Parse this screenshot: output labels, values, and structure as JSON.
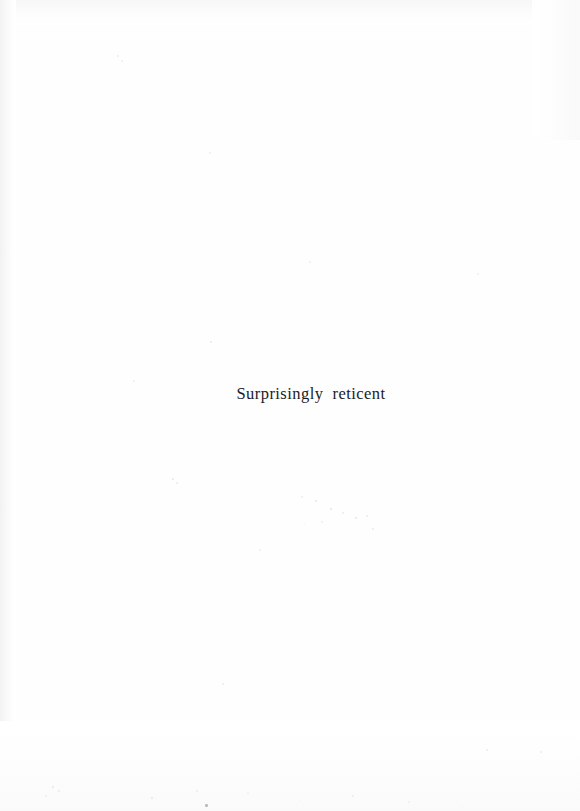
{
  "page": {
    "kind": "scanned-book-page",
    "width": 580,
    "height": 811,
    "background_color": "#ffffff",
    "paper_color": "#fefefe"
  },
  "content": {
    "line": "Surprisingly reticent",
    "text_color": "#1b1b1d",
    "alignment": "center"
  },
  "artifacts": {
    "label": "scan speckles",
    "specks": [
      {
        "x": 117,
        "y": 55,
        "size": 2.0,
        "color": "#eceded"
      },
      {
        "x": 121,
        "y": 60,
        "size": 1.6,
        "color": "#f0f0f1"
      },
      {
        "x": 173,
        "y": 117,
        "size": 1.4,
        "color": "#f1f1f2"
      },
      {
        "x": 209,
        "y": 152,
        "size": 1.5,
        "color": "#f0f0f1"
      },
      {
        "x": 309,
        "y": 261,
        "size": 1.8,
        "color": "#ebecec"
      },
      {
        "x": 477,
        "y": 273,
        "size": 1.5,
        "color": "#eff0f0"
      },
      {
        "x": 210,
        "y": 341,
        "size": 1.9,
        "color": "#e9eaea"
      },
      {
        "x": 133,
        "y": 380,
        "size": 1.5,
        "color": "#f0f0f1"
      },
      {
        "x": 172,
        "y": 478,
        "size": 2.2,
        "color": "#e6e7e8"
      },
      {
        "x": 176,
        "y": 482,
        "size": 1.5,
        "color": "#ededee"
      },
      {
        "x": 301,
        "y": 496,
        "size": 1.6,
        "color": "#edeeee"
      },
      {
        "x": 315,
        "y": 500,
        "size": 1.7,
        "color": "#eaebeb"
      },
      {
        "x": 330,
        "y": 508,
        "size": 2.4,
        "color": "#e3e4e5"
      },
      {
        "x": 342,
        "y": 512,
        "size": 1.8,
        "color": "#e9eaea"
      },
      {
        "x": 355,
        "y": 517,
        "size": 2.1,
        "color": "#e6e7e8"
      },
      {
        "x": 366,
        "y": 515,
        "size": 1.6,
        "color": "#ececed"
      },
      {
        "x": 321,
        "y": 521,
        "size": 1.5,
        "color": "#eeeeef"
      },
      {
        "x": 304,
        "y": 524,
        "size": 1.4,
        "color": "#f0f0f1"
      },
      {
        "x": 372,
        "y": 528,
        "size": 1.6,
        "color": "#ebecec"
      },
      {
        "x": 347,
        "y": 533,
        "size": 1.3,
        "color": "#f1f1f2"
      },
      {
        "x": 259,
        "y": 549,
        "size": 1.5,
        "color": "#eff0f0"
      },
      {
        "x": 222,
        "y": 683,
        "size": 1.6,
        "color": "#ededee"
      },
      {
        "x": 234,
        "y": 690,
        "size": 1.4,
        "color": "#f0f0f1"
      },
      {
        "x": 486,
        "y": 749,
        "size": 1.5,
        "color": "#eeeeef"
      },
      {
        "x": 540,
        "y": 751,
        "size": 1.6,
        "color": "#ebecec"
      },
      {
        "x": 52,
        "y": 786,
        "size": 2.2,
        "color": "#e4e5e6"
      },
      {
        "x": 58,
        "y": 790,
        "size": 1.8,
        "color": "#e9eaea"
      },
      {
        "x": 45,
        "y": 795,
        "size": 1.5,
        "color": "#eeeeef"
      },
      {
        "x": 151,
        "y": 797,
        "size": 1.7,
        "color": "#eaebeb"
      },
      {
        "x": 205,
        "y": 804,
        "size": 2.6,
        "color": "#b9babc"
      },
      {
        "x": 196,
        "y": 790,
        "size": 1.5,
        "color": "#eeeeef"
      },
      {
        "x": 247,
        "y": 792,
        "size": 1.5,
        "color": "#eff0f0"
      },
      {
        "x": 299,
        "y": 800,
        "size": 1.4,
        "color": "#f0f0f1"
      },
      {
        "x": 352,
        "y": 795,
        "size": 1.6,
        "color": "#ececed"
      },
      {
        "x": 408,
        "y": 801,
        "size": 1.5,
        "color": "#eeeeef"
      },
      {
        "x": 462,
        "y": 806,
        "size": 1.4,
        "color": "#f0f0f1"
      }
    ]
  }
}
